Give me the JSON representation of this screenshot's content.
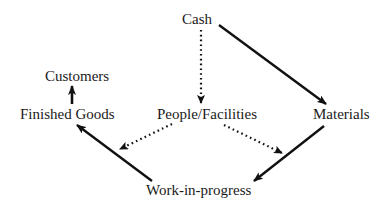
{
  "diagram": {
    "type": "flow",
    "nodes": [
      {
        "id": "cash",
        "label": "Cash"
      },
      {
        "id": "customers",
        "label": "Customers"
      },
      {
        "id": "finished_goods",
        "label": "Finished Goods"
      },
      {
        "id": "people_facilities",
        "label": "People/Facilities"
      },
      {
        "id": "materials",
        "label": "Materials"
      },
      {
        "id": "work_in_progress",
        "label": "Work-in-progress"
      }
    ],
    "edges": [
      {
        "from": "cash",
        "to": "materials",
        "style": "solid"
      },
      {
        "from": "cash",
        "to": "people_facilities",
        "style": "dotted"
      },
      {
        "from": "people_facilities",
        "to": "finished_goods",
        "style": "dotted"
      },
      {
        "from": "people_facilities",
        "to": "work_in_progress",
        "style": "dotted"
      },
      {
        "from": "materials",
        "to": "work_in_progress",
        "style": "solid"
      },
      {
        "from": "work_in_progress",
        "to": "finished_goods",
        "style": "solid"
      },
      {
        "from": "finished_goods",
        "to": "customers",
        "style": "solid"
      }
    ],
    "colors": {
      "line": "#111111",
      "text": "#1a1a1a",
      "background": "#ffffff"
    }
  }
}
